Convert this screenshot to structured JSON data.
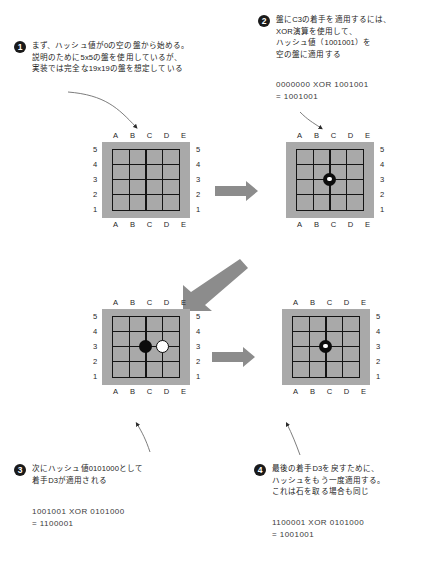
{
  "diagram": {
    "board_colors": {
      "board_background": "#a9a9a9",
      "grid_line": "#141414",
      "black_stone": "#0c0c0c",
      "white_stone": "#ffffff",
      "arrow_gray": "#8c8c8c",
      "text": "#232323"
    },
    "board_labels": {
      "columns": [
        "A",
        "B",
        "C",
        "D",
        "E"
      ],
      "rows_top_to_bottom": [
        "5",
        "4",
        "3",
        "2",
        "1"
      ]
    },
    "steps": [
      {
        "number": "1",
        "text_lines": [
          "まず、ハッシュ値が0の空の盤から始める。",
          "説明のために5x5の盤を使用しているが、",
          "実装では完全な19x19の盤を想定している"
        ],
        "formula_lines": []
      },
      {
        "number": "2",
        "text_lines": [
          "盤にC3の着手を適用するには、",
          "XOR演算を使用して、",
          "ハッシュ値（1001001）を",
          "空の盤に適用する"
        ],
        "formula_lines": [
          "0000000 XOR 1001001",
          "= 1001001"
        ]
      },
      {
        "number": "3",
        "text_lines": [
          "次にハッシュ値0101000として",
          "着手D3が適用される"
        ],
        "formula_lines": [
          "1001001 XOR 0101000",
          "= 1100001"
        ]
      },
      {
        "number": "4",
        "text_lines": [
          "最後の着手D3を戻すために、",
          "ハッシュをもう一度適用する。",
          "これは石を取る場合も同じ"
        ],
        "formula_lines": [
          "1100001 XOR 0101000",
          "= 1001001"
        ]
      }
    ],
    "boards": [
      {
        "id": "board-1",
        "caption": "empty board",
        "stones": []
      },
      {
        "id": "board-2",
        "caption": "C3 black played",
        "stones": [
          {
            "color": "black-marked",
            "col": "C",
            "row": "3"
          }
        ]
      },
      {
        "id": "board-3",
        "caption": "C3 black, D3 white",
        "stones": [
          {
            "color": "black",
            "col": "C",
            "row": "3"
          },
          {
            "color": "white",
            "col": "D",
            "row": "3"
          }
        ]
      },
      {
        "id": "board-4",
        "caption": "D3 undone, C3 black remains",
        "stones": [
          {
            "color": "black-marked",
            "col": "C",
            "row": "3"
          }
        ]
      }
    ],
    "arrows": [
      {
        "name": "arrow-board1-to-board2",
        "direction": "right"
      },
      {
        "name": "arrow-board2-to-board3",
        "direction": "down-left"
      },
      {
        "name": "arrow-board3-to-board4",
        "direction": "right"
      }
    ]
  }
}
